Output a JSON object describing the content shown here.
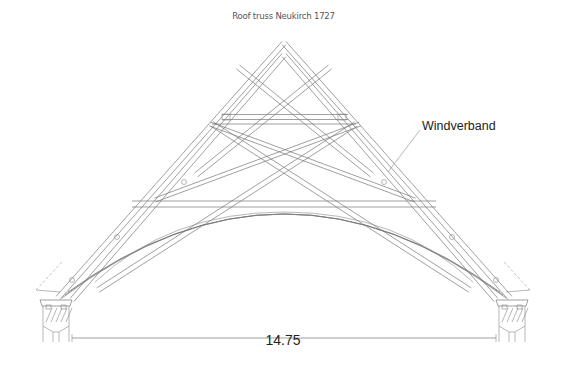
{
  "title": "Roof truss Neukirch 1727",
  "labels": {
    "windverband": "Windverband",
    "span_dimension": "14.75"
  },
  "colors": {
    "line": "#777777",
    "text": "#222222"
  }
}
